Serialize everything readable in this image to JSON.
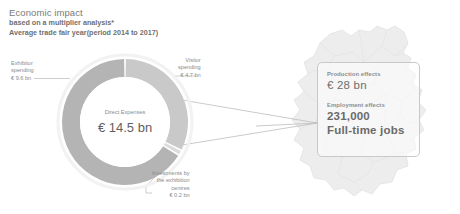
{
  "title": {
    "heading": "Economic impact",
    "line2": "based on a multiplier analysis*",
    "line3": "Average trade fair year(period 2014 to 2017)"
  },
  "donut": {
    "center_label": "Direct Expenses",
    "center_value": "€ 14.5 bn",
    "labels": {
      "exhibitor": {
        "line1": "Exhibitor",
        "line2": "spending",
        "value": "€ 9.6 bn"
      },
      "visitor": {
        "line1": "Visitor",
        "line2": "spending",
        "value": "€ 4.7 bn"
      },
      "investments": {
        "line1": "Investments by",
        "line2": "the exhibition",
        "line3": "centres",
        "value": "€ 0.2 bn"
      }
    }
  },
  "info_box": {
    "production_caption": "Production effects",
    "production_value": "€ 28 bn",
    "employment_caption": "Employment effects",
    "employment_value": "231,000",
    "employment_unit": "Full-time jobs"
  },
  "colors": {
    "exhibitor_segment": "#b4b4b4",
    "visitor_segment": "#c9c9c9",
    "investments_segment": "#dcdcdc",
    "map_fill": "#ededed",
    "map_stroke": "#e3e3e3",
    "text_gray": "#8a8a8a",
    "box_border": "#c9c9c9",
    "leader_line": "#b9b9b9"
  },
  "chart_data": {
    "type": "pie",
    "title": "Direct Expenses",
    "total": 14.5,
    "unit": "€ bn",
    "categories": [
      "Exhibitor spending",
      "Visitor spending",
      "Investments by the exhibition centres"
    ],
    "values": [
      9.6,
      4.7,
      0.2
    ],
    "labels": [
      "€ 9.6 bn",
      "€ 4.7 bn",
      "€ 0.2 bn"
    ],
    "colors": [
      "#b4b4b4",
      "#c9c9c9",
      "#dcdcdc"
    ],
    "donut": true,
    "legend": "callout-labels",
    "annotations": [
      {
        "caption": "Production effects",
        "value": "€ 28 bn"
      },
      {
        "caption": "Employment effects",
        "value": "231,000",
        "unit": "Full-time jobs"
      }
    ]
  }
}
